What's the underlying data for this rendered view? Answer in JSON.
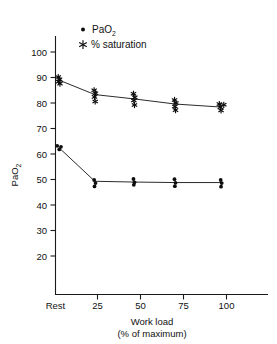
{
  "figure": {
    "background": "#ffffff",
    "ink_color": "#111111"
  },
  "legend": {
    "position": "top-center",
    "entries": [
      {
        "marker": "dot-marker-icon",
        "label": "PaO",
        "sub": "2"
      },
      {
        "marker": "asterisk-marker-icon",
        "label": "% saturation",
        "sub": ""
      }
    ]
  },
  "axes": {
    "y": {
      "title_main": "PaO",
      "title_sub": "2",
      "ticks": [
        20,
        30,
        40,
        50,
        60,
        70,
        80,
        90,
        100
      ],
      "tick_labels": [
        "20",
        "30",
        "40",
        "50",
        "60",
        "70",
        "80",
        "90",
        "100"
      ],
      "min": 8,
      "max": 104
    },
    "x": {
      "title_line1": "Work load",
      "title_line2": "(% of maximum)",
      "ticks": [
        0,
        25,
        50,
        75,
        100
      ],
      "tick_labels": [
        "Rest",
        "25",
        "50",
        "75",
        "100"
      ],
      "min": -9,
      "max": 113
    }
  },
  "chart_data": {
    "type": "scatter",
    "title": "",
    "xlabel": "Work load (% of maximum)",
    "ylabel": "PaO2",
    "xlim": [
      -9,
      113
    ],
    "ylim": [
      8,
      104
    ],
    "xtick_labels": [
      "Rest",
      "25",
      "50",
      "75",
      "100"
    ],
    "xticks": [
      0,
      25,
      50,
      75,
      100
    ],
    "yticks": [
      20,
      30,
      40,
      50,
      60,
      70,
      80,
      90,
      100
    ],
    "grid": false,
    "legend_position": "top-center",
    "x_categories": [
      "Rest",
      "25",
      "50",
      "75",
      "100"
    ],
    "series": [
      {
        "name": "PaO2",
        "marker": "dot",
        "connected": true,
        "mean_x": [
          2,
          23,
          46,
          70,
          97
        ],
        "mean_values": [
          62.5,
          49.3,
          49.0,
          48.8,
          48.8
        ],
        "points": [
          {
            "x": 1.0,
            "y": 63.2
          },
          {
            "x": 3.2,
            "y": 62.8
          },
          {
            "x": 2.2,
            "y": 61.8
          },
          {
            "x": 22.6,
            "y": 49.8
          },
          {
            "x": 23.4,
            "y": 48.6
          },
          {
            "x": 22.8,
            "y": 47.3
          },
          {
            "x": 45.6,
            "y": 50.2
          },
          {
            "x": 46.2,
            "y": 48.9
          },
          {
            "x": 45.8,
            "y": 47.9
          },
          {
            "x": 69.6,
            "y": 50.1
          },
          {
            "x": 70.2,
            "y": 48.7
          },
          {
            "x": 69.8,
            "y": 47.4
          },
          {
            "x": 96.6,
            "y": 49.8
          },
          {
            "x": 97.2,
            "y": 48.6
          },
          {
            "x": 96.8,
            "y": 47.2
          }
        ]
      },
      {
        "name": "% saturation",
        "marker": "asterisk",
        "connected": true,
        "mean_x": [
          2,
          23,
          46,
          70,
          97
        ],
        "mean_values": [
          89.0,
          83.3,
          81.6,
          79.6,
          78.4
        ],
        "points": [
          {
            "x": 1.6,
            "y": 90.2
          },
          {
            "x": 2.4,
            "y": 89.3
          },
          {
            "x": 1.8,
            "y": 88.4
          },
          {
            "x": 2.6,
            "y": 87.6
          },
          {
            "x": 22.6,
            "y": 85.0
          },
          {
            "x": 23.4,
            "y": 83.8
          },
          {
            "x": 22.8,
            "y": 82.4
          },
          {
            "x": 23.2,
            "y": 80.6
          },
          {
            "x": 45.6,
            "y": 83.6
          },
          {
            "x": 46.4,
            "y": 82.2
          },
          {
            "x": 45.8,
            "y": 81.0
          },
          {
            "x": 46.2,
            "y": 79.2
          },
          {
            "x": 69.6,
            "y": 81.2
          },
          {
            "x": 70.4,
            "y": 80.0
          },
          {
            "x": 69.8,
            "y": 78.6
          },
          {
            "x": 70.2,
            "y": 77.2
          },
          {
            "x": 95.8,
            "y": 79.6
          },
          {
            "x": 98.4,
            "y": 79.3
          },
          {
            "x": 96.4,
            "y": 78.4
          },
          {
            "x": 96.8,
            "y": 77.1
          }
        ]
      }
    ]
  }
}
